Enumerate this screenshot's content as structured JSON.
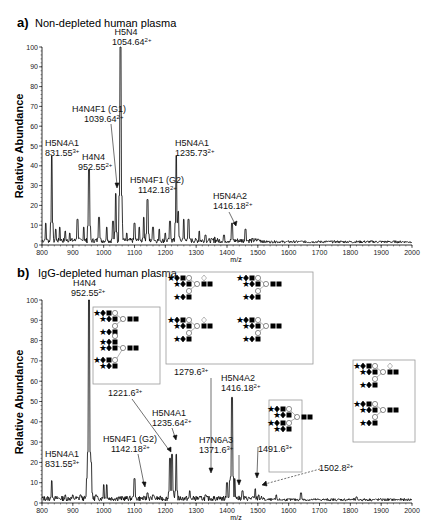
{
  "chart_data": [
    {
      "type": "line",
      "panel": "a",
      "title": "Non-depleted human plasma",
      "xlabel": "m/z",
      "ylabel": "Relative Abundance",
      "xlim": [
        800,
        2000
      ],
      "ylim": [
        0,
        100
      ],
      "xticks": [
        800,
        900,
        1000,
        1100,
        1200,
        1300,
        1400,
        1500,
        1600,
        1700,
        1800,
        1900,
        2000
      ],
      "yticks": [
        0,
        10,
        20,
        30,
        40,
        50,
        60,
        70,
        80,
        90,
        100
      ],
      "grid": false,
      "peaks": [
        {
          "mz": 812,
          "y": 11
        },
        {
          "mz": 831.55,
          "y": 45
        },
        {
          "mz": 845,
          "y": 8
        },
        {
          "mz": 858,
          "y": 9
        },
        {
          "mz": 875,
          "y": 7
        },
        {
          "mz": 890,
          "y": 6
        },
        {
          "mz": 915,
          "y": 13
        },
        {
          "mz": 935,
          "y": 9
        },
        {
          "mz": 952.55,
          "y": 38
        },
        {
          "mz": 985,
          "y": 14
        },
        {
          "mz": 1010,
          "y": 9
        },
        {
          "mz": 1030,
          "y": 12
        },
        {
          "mz": 1039.64,
          "y": 26
        },
        {
          "mz": 1054.64,
          "y": 100
        },
        {
          "mz": 1060,
          "y": 11
        },
        {
          "mz": 1075,
          "y": 6
        },
        {
          "mz": 1100,
          "y": 11
        },
        {
          "mz": 1115,
          "y": 9
        },
        {
          "mz": 1130,
          "y": 14
        },
        {
          "mz": 1142.18,
          "y": 23
        },
        {
          "mz": 1160,
          "y": 9
        },
        {
          "mz": 1180,
          "y": 8
        },
        {
          "mz": 1200,
          "y": 6
        },
        {
          "mz": 1215,
          "y": 12
        },
        {
          "mz": 1235.73,
          "y": 45
        },
        {
          "mz": 1242,
          "y": 17
        },
        {
          "mz": 1260,
          "y": 13
        },
        {
          "mz": 1275,
          "y": 13
        },
        {
          "mz": 1310,
          "y": 7
        },
        {
          "mz": 1330,
          "y": 5
        },
        {
          "mz": 1360,
          "y": 4
        },
        {
          "mz": 1390,
          "y": 5
        },
        {
          "mz": 1416.18,
          "y": 11
        },
        {
          "mz": 1460,
          "y": 8
        },
        {
          "mz": 1500,
          "y": 3
        },
        {
          "mz": 1560,
          "y": 2
        },
        {
          "mz": 1640,
          "y": 2
        }
      ],
      "annotations": [
        {
          "label": "H5N4",
          "value": "1054.64",
          "charge": "2+"
        },
        {
          "label": "H4N4F1 (G1)",
          "value": "1039.64",
          "charge": "2+"
        },
        {
          "label": "H5N4A1",
          "value": "831.55",
          "charge": "3+"
        },
        {
          "label": "H4N4",
          "value": "952.55",
          "charge": "2+"
        },
        {
          "label": "H5N4A1",
          "value": "1235.73",
          "charge": "2+"
        },
        {
          "label": "H5N4F1 (G2)",
          "value": "1142.18",
          "charge": "2+"
        },
        {
          "label": "H5N4A2",
          "value": "1416.18",
          "charge": "2+"
        }
      ]
    },
    {
      "type": "line",
      "panel": "b",
      "title": "IgG-depleted human plasma",
      "xlabel": "m/z",
      "ylabel": "Relative Abundance",
      "xlim": [
        800,
        2000
      ],
      "ylim": [
        0,
        100
      ],
      "xticks": [
        800,
        900,
        1000,
        1100,
        1200,
        1300,
        1400,
        1500,
        1600,
        1700,
        1800,
        1900,
        2000
      ],
      "yticks": [
        0,
        10,
        20,
        30,
        40,
        50,
        60,
        70,
        80,
        90,
        100
      ],
      "grid": false,
      "peaks": [
        {
          "mz": 831.55,
          "y": 11
        },
        {
          "mz": 875,
          "y": 4
        },
        {
          "mz": 900,
          "y": 4
        },
        {
          "mz": 925,
          "y": 4
        },
        {
          "mz": 945,
          "y": 12
        },
        {
          "mz": 952.55,
          "y": 100
        },
        {
          "mz": 960,
          "y": 20
        },
        {
          "mz": 975,
          "y": 4
        },
        {
          "mz": 1000,
          "y": 9
        },
        {
          "mz": 1010,
          "y": 9
        },
        {
          "mz": 1050,
          "y": 3
        },
        {
          "mz": 1100,
          "y": 12
        },
        {
          "mz": 1142.18,
          "y": 5
        },
        {
          "mz": 1160,
          "y": 4
        },
        {
          "mz": 1215,
          "y": 22
        },
        {
          "mz": 1221.6,
          "y": 24
        },
        {
          "mz": 1235.64,
          "y": 24
        },
        {
          "mz": 1279.6,
          "y": 6
        },
        {
          "mz": 1300,
          "y": 3
        },
        {
          "mz": 1330,
          "y": 4
        },
        {
          "mz": 1371.6,
          "y": 3
        },
        {
          "mz": 1400,
          "y": 10
        },
        {
          "mz": 1410,
          "y": 11
        },
        {
          "mz": 1416.18,
          "y": 52
        },
        {
          "mz": 1425,
          "y": 12
        },
        {
          "mz": 1450,
          "y": 6
        },
        {
          "mz": 1491.6,
          "y": 7
        },
        {
          "mz": 1502.8,
          "y": 4
        },
        {
          "mz": 1560,
          "y": 4
        },
        {
          "mz": 1640,
          "y": 5
        },
        {
          "mz": 1820,
          "y": 3
        }
      ],
      "annotations": [
        {
          "label": "H4N4",
          "value": "952.55",
          "charge": "2+"
        },
        {
          "label": "",
          "value": "1221.6",
          "charge": "3+"
        },
        {
          "label": "",
          "value": "1279.6",
          "charge": "3+"
        },
        {
          "label": "H5N4A1",
          "value": "1235.64",
          "charge": "2+"
        },
        {
          "label": "H5N4A2",
          "value": "1416.18",
          "charge": "2+"
        },
        {
          "label": "H5N4F1 (G2)",
          "value": "1142.18",
          "charge": "2+"
        },
        {
          "label": "H7N6A3",
          "value": "1371.6",
          "charge": "3+"
        },
        {
          "label": "",
          "value": "1491.6",
          "charge": "3+"
        },
        {
          "label": "",
          "value": "1502.8",
          "charge": "2+"
        },
        {
          "label": "H5N4A1",
          "value": "831.55",
          "charge": "3+"
        }
      ]
    }
  ],
  "panels": {
    "a": {
      "letter": "a)",
      "title": "Non-depleted human plasma",
      "ylabel": "Relative Abundance",
      "xlabel": "m/z"
    },
    "b": {
      "letter": "b)",
      "title": "IgG-depleted human plasma",
      "ylabel": "Relative Abundance",
      "xlabel": "m/z"
    }
  },
  "labels_a": {
    "h5n4": "H5N4",
    "h5n4_v": "1054.64",
    "g1": "H4N4F1 (G1)",
    "g1_v": "1039.64",
    "a1l": "H5N4A1",
    "a1l_v": "831.55",
    "h4n4": "H4N4",
    "h4n4_v": "952.55",
    "a1r": "H5N4A1",
    "a1r_v": "1235.73",
    "g2": "H5N4F1 (G2)",
    "g2_v": "1142.18",
    "a2": "H5N4A2",
    "a2_v": "1416.18"
  },
  "labels_b": {
    "h4n4": "H4N4",
    "h4n4_v": "952.55",
    "p1221": "1221.6",
    "p1279": "1279.6",
    "a1": "H5N4A1",
    "a1_v": "1235.64",
    "a2": "H5N4A2",
    "a2_v": "1416.18",
    "g2": "H5N4F1 (G2)",
    "g2_v": "1142.18",
    "a3": "H7N6A3",
    "a3_v": "1371.6",
    "p1491": "1491.6",
    "p1502": "1502.8",
    "a1l": "H5N4A1",
    "a1l_v": "831.55"
  },
  "charges": {
    "two": "2+",
    "three": "3+"
  }
}
